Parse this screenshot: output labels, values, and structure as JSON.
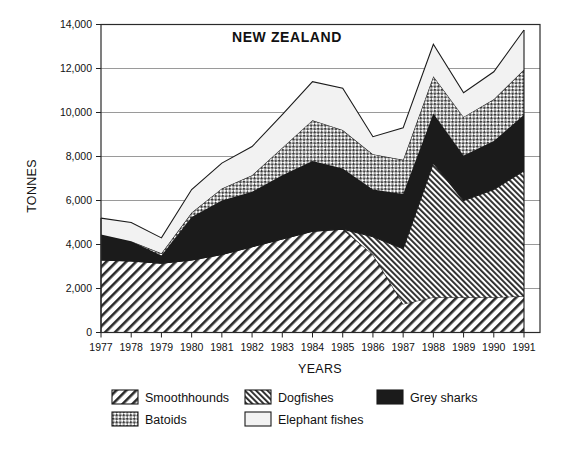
{
  "chart_data": {
    "type": "area",
    "title": "NEW ZEALAND",
    "xlabel": "YEARS",
    "ylabel": "TONNES",
    "stacked": true,
    "grid": true,
    "legend_position": "bottom",
    "categories": [
      1977,
      1978,
      1979,
      1980,
      1981,
      1982,
      1983,
      1984,
      1985,
      1986,
      1987,
      1988,
      1989,
      1990,
      1991
    ],
    "x": [
      "1977",
      "1978",
      "1979",
      "1980",
      "1981",
      "1982",
      "1983",
      "1984",
      "1985",
      "1986",
      "1987",
      "1988",
      "1989",
      "1990",
      "1991"
    ],
    "xlim": [
      1977,
      1991
    ],
    "ylim": [
      0,
      14000
    ],
    "yticks": [
      0,
      2000,
      4000,
      6000,
      8000,
      10000,
      12000,
      14000
    ],
    "ytick_labels": [
      "0",
      "2,000",
      "4,000",
      "6,000",
      "8,000",
      "10,000",
      "12,000",
      "14,000"
    ],
    "series": [
      {
        "name": "Smoothhounds",
        "pattern": "diagonal-hatch-right",
        "values": [
          3300,
          3250,
          3150,
          3300,
          3550,
          3900,
          4250,
          4600,
          4700,
          3550,
          1300,
          1600,
          1600,
          1600,
          1650
        ]
      },
      {
        "name": "Dogfishes",
        "pattern": "diagonal-hatch-dense",
        "values": [
          0,
          0,
          0,
          0,
          0,
          0,
          0,
          0,
          0,
          800,
          2500,
          6100,
          4400,
          4900,
          5700
        ]
      },
      {
        "name": "Grey sharks",
        "pattern": "solid-black",
        "values": [
          1150,
          900,
          350,
          1950,
          2450,
          2500,
          2900,
          3200,
          2750,
          2150,
          2500,
          2250,
          2050,
          2200,
          2550
        ]
      },
      {
        "name": "Batoids",
        "pattern": "crosshatch",
        "values": [
          0,
          0,
          100,
          200,
          550,
          750,
          1250,
          1850,
          1750,
          1600,
          1550,
          1700,
          1750,
          1900,
          2050
        ]
      },
      {
        "name": "Elephant fishes",
        "pattern": "white-open",
        "values": [
          750,
          850,
          700,
          1050,
          1150,
          1300,
          1500,
          1750,
          1900,
          800,
          1450,
          1450,
          1100,
          1250,
          1800
        ]
      }
    ],
    "stack_totals": [
      5200,
      5000,
      4300,
      6500,
      7700,
      8450,
      9900,
      11400,
      11100,
      8900,
      9300,
      13100,
      10900,
      11850,
      13750
    ]
  },
  "legend": {
    "items": [
      {
        "label": "Smoothhounds",
        "pattern": "diagonal-hatch-right"
      },
      {
        "label": "Dogfishes",
        "pattern": "diagonal-hatch-dense"
      },
      {
        "label": "Grey sharks",
        "pattern": "solid-black"
      },
      {
        "label": "Batoids",
        "pattern": "crosshatch"
      },
      {
        "label": "Elephant fishes",
        "pattern": "white-open"
      }
    ]
  },
  "colors": {
    "line": "#1a1a1a",
    "grid": "#6f6f6f",
    "black_fill": "#1b1b1b",
    "white_fill": "#f2f2f2",
    "text": "#111111"
  }
}
